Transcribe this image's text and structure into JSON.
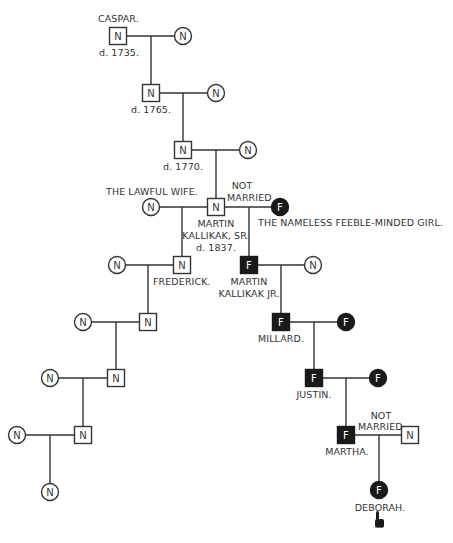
{
  "legend": {
    "normal_symbol": "N",
    "feebleminded_symbol": "F",
    "colors": {
      "normal_fill": "#ffffff",
      "feebleminded_fill": "#1a1a1a",
      "line": "#333333"
    }
  },
  "labels": {
    "caspar_name": "CASPAR.",
    "caspar_death": "d. 1735.",
    "gen2_death": "d. 1765.",
    "gen3_death": "d. 1770.",
    "lawful_wife": "THE LAWFUL WIFE.",
    "not_married_1_line1": "NOT",
    "not_married_1_line2": "MARRIED",
    "martin_sr_line1": "MARTIN",
    "martin_sr_line2": "KALLIKAK, SR.",
    "martin_sr_death": "d. 1837.",
    "nameless_girl": "THE NAMELESS FEEBLE-MINDED GIRL.",
    "frederick": "FREDERICK.",
    "martin_jr_line1": "MARTIN",
    "martin_jr_line2": "KALLIKAK JR.",
    "millard": "MILLARD.",
    "justin": "JUSTIN.",
    "not_married_2_line1": "NOT",
    "not_married_2_line2": "MARRIED",
    "martha": "MARTHA.",
    "deborah": "DEBORAH."
  },
  "nodes": [
    {
      "id": "caspar",
      "shape": "square",
      "status": "N",
      "x": 118,
      "y": 36
    },
    {
      "id": "caspar-wife",
      "shape": "circle",
      "status": "N",
      "x": 183,
      "y": 36
    },
    {
      "id": "gen2",
      "shape": "square",
      "status": "N",
      "x": 151,
      "y": 93
    },
    {
      "id": "gen2-wife",
      "shape": "circle",
      "status": "N",
      "x": 216,
      "y": 93
    },
    {
      "id": "gen3",
      "shape": "square",
      "status": "N",
      "x": 183,
      "y": 150
    },
    {
      "id": "gen3-wife",
      "shape": "circle",
      "status": "N",
      "x": 248,
      "y": 150
    },
    {
      "id": "martin-sr",
      "shape": "square",
      "status": "N",
      "x": 216,
      "y": 207
    },
    {
      "id": "lawful-wife",
      "shape": "circle",
      "status": "N",
      "x": 151,
      "y": 207
    },
    {
      "id": "nameless-girl",
      "shape": "circle",
      "status": "F",
      "x": 280,
      "y": 207
    },
    {
      "id": "frederick",
      "shape": "square",
      "status": "N",
      "x": 182,
      "y": 265
    },
    {
      "id": "frederick-wife",
      "shape": "circle",
      "status": "N",
      "x": 117,
      "y": 265
    },
    {
      "id": "martin-jr",
      "shape": "square",
      "status": "F",
      "x": 249,
      "y": 265
    },
    {
      "id": "martin-jr-wife",
      "shape": "circle",
      "status": "N",
      "x": 313,
      "y": 265
    },
    {
      "id": "lawful-gen2",
      "shape": "square",
      "status": "N",
      "x": 148,
      "y": 322
    },
    {
      "id": "lawful-gen2-wife",
      "shape": "circle",
      "status": "N",
      "x": 83,
      "y": 322
    },
    {
      "id": "millard",
      "shape": "square",
      "status": "F",
      "x": 281,
      "y": 322
    },
    {
      "id": "millard-wife",
      "shape": "circle",
      "status": "F",
      "x": 346,
      "y": 322
    },
    {
      "id": "lawful-gen3",
      "shape": "square",
      "status": "N",
      "x": 116,
      "y": 378
    },
    {
      "id": "lawful-gen3-wife",
      "shape": "circle",
      "status": "N",
      "x": 50,
      "y": 378
    },
    {
      "id": "justin",
      "shape": "square",
      "status": "F",
      "x": 314,
      "y": 378
    },
    {
      "id": "justin-wife",
      "shape": "circle",
      "status": "F",
      "x": 378,
      "y": 378
    },
    {
      "id": "lawful-gen4",
      "shape": "square",
      "status": "N",
      "x": 83,
      "y": 435
    },
    {
      "id": "lawful-gen4-wife",
      "shape": "circle",
      "status": "N",
      "x": 17,
      "y": 435
    },
    {
      "id": "martha",
      "shape": "square",
      "status": "F",
      "x": 346,
      "y": 435
    },
    {
      "id": "martha-partner",
      "shape": "square",
      "status": "N",
      "x": 410,
      "y": 435
    },
    {
      "id": "lawful-gen5",
      "shape": "circle",
      "status": "N",
      "x": 50,
      "y": 492
    },
    {
      "id": "deborah",
      "shape": "circle",
      "status": "F",
      "x": 379,
      "y": 490
    }
  ],
  "unions": [
    {
      "a": "caspar",
      "b": "caspar-wife",
      "jx": 151,
      "child_y": 93
    },
    {
      "a": "gen2",
      "b": "gen2-wife",
      "jx": 183,
      "child_y": 150
    },
    {
      "a": "gen3",
      "b": "gen3-wife",
      "jx": 216,
      "child_y": 207
    },
    {
      "a": "lawful-wife",
      "b": "martin-sr",
      "jx": 182,
      "child_y": 265
    },
    {
      "a": "martin-sr",
      "b": "nameless-girl",
      "jx": 249,
      "child_y": 265
    },
    {
      "a": "frederick-wife",
      "b": "frederick",
      "jx": 148,
      "child_y": 322
    },
    {
      "a": "martin-jr",
      "b": "martin-jr-wife",
      "jx": 281,
      "child_y": 322
    },
    {
      "a": "lawful-gen2-wife",
      "b": "lawful-gen2",
      "jx": 116,
      "child_y": 378
    },
    {
      "a": "millard",
      "b": "millard-wife",
      "jx": 314,
      "child_y": 378
    },
    {
      "a": "lawful-gen3-wife",
      "b": "lawful-gen3",
      "jx": 83,
      "child_y": 435
    },
    {
      "a": "justin",
      "b": "justin-wife",
      "jx": 346,
      "child_y": 435
    },
    {
      "a": "lawful-gen4-wife",
      "b": "lawful-gen4",
      "jx": 50,
      "child_y": 492
    },
    {
      "a": "martha",
      "b": "martha-partner",
      "jx": 379,
      "child_y": 490
    }
  ],
  "pointer": {
    "icon": "pointing-hand-icon",
    "x": 379,
    "y": 523
  }
}
